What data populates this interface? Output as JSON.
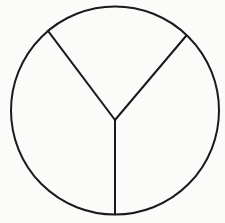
{
  "diagram": {
    "type": "circle-divided-into-three-sectors",
    "background": "#fbfbfa",
    "stroke_color": "#1a1a1a",
    "stroke_width": 2,
    "circle": {
      "cx": 115,
      "cy": 110.5,
      "r": 104
    },
    "hub": {
      "x": 115,
      "y": 120
    },
    "dividers": [
      {
        "name": "upper-left-divider",
        "x": 48,
        "y": 31
      },
      {
        "name": "upper-right-divider",
        "x": 186,
        "y": 36
      },
      {
        "name": "bottom-divider",
        "x": 115,
        "y": 214
      }
    ],
    "regions": [
      {
        "name": "top-region",
        "approx_angle_deg": 77
      },
      {
        "name": "right-region",
        "approx_angle_deg": 140
      },
      {
        "name": "left-region",
        "approx_angle_deg": 143
      }
    ],
    "labels": []
  }
}
